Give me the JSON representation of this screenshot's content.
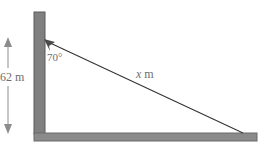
{
  "diagram": {
    "type": "right-triangle-word-problem",
    "labels": {
      "height": "62 m",
      "angle": "70°",
      "hypotenuse_var": "x",
      "hypotenuse_unit": " m"
    },
    "colors": {
      "wall": "#808080",
      "wall_edge": "#5a5a5a",
      "ground": "#8a8a8a",
      "line": "#333333",
      "dimension": "#8c8c8c",
      "text": "#6e6e6e"
    }
  }
}
